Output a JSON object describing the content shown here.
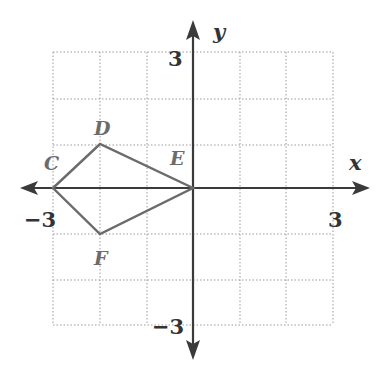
{
  "diagram": {
    "type": "coordinate-plane-polygon",
    "axes": {
      "x_label": "x",
      "y_label": "y",
      "x_range": [
        -3,
        3
      ],
      "y_range": [
        -3,
        3
      ],
      "grid": true,
      "grid_step": 1
    },
    "tick_labels": {
      "x_min": "−3",
      "x_max": "3",
      "y_max": "3",
      "y_min": "−3"
    },
    "polygon": {
      "name": "CDEF",
      "vertices": [
        {
          "label": "C",
          "x": -3,
          "y": 0
        },
        {
          "label": "D",
          "x": -2,
          "y": 1
        },
        {
          "label": "E",
          "x": 0,
          "y": 0
        },
        {
          "label": "F",
          "x": -2,
          "y": -1
        }
      ]
    },
    "colors": {
      "axis": "#3a3a3a",
      "grid": "#9a9a9a",
      "polygon": "#6b6b6b",
      "background": "#ffffff"
    }
  }
}
